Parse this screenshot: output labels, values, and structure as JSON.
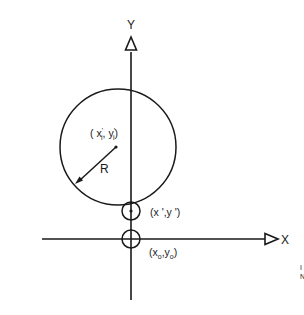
{
  "diagram": {
    "axes": {
      "y_label": "Y",
      "x_label": "X"
    },
    "circle": {
      "center_label_open": "( x",
      "center_label_sub_x": "i",
      "center_label_sep": ", y",
      "center_label_sub_y": "i",
      "center_label_close": ")",
      "radius_label": "R"
    },
    "point_prime": {
      "label": "(x ',y ')"
    },
    "origin": {
      "label_open": "(x",
      "sub_x": "o",
      "label_sep": ",y",
      "sub_y": "o",
      "label_close": ")"
    },
    "margin_marks": {
      "line1": "I",
      "line2": "N"
    },
    "colors": {
      "stroke": "#1a1a1a",
      "background": "#ffffff"
    }
  }
}
